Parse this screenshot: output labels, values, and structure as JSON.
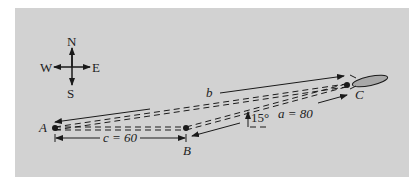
{
  "diagram": {
    "compass": {
      "north": "N",
      "south": "S",
      "east": "E",
      "west": "W"
    },
    "points": {
      "A": "A",
      "B": "B",
      "C": "C"
    },
    "labels": {
      "side_b": "b",
      "side_c": "c = 60",
      "side_a": "a = 80",
      "angle": "15°"
    },
    "colors": {
      "panel": "#d2d2d2",
      "ink": "#1a1a1a",
      "rocket_fill": "#a8a8a8"
    }
  }
}
